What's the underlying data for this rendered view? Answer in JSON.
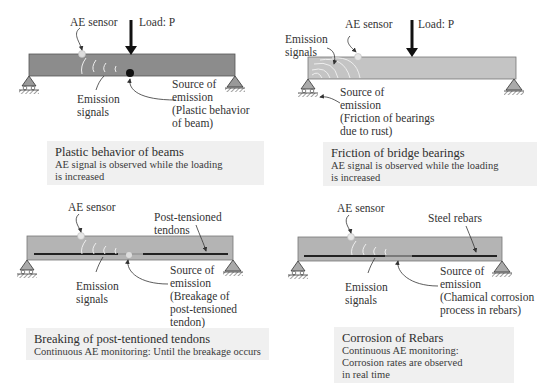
{
  "panels": [
    {
      "id": "plastic-behavior",
      "labels": {
        "sensor": "AE sensor",
        "load": "Load: P",
        "signals": "Emission\nsignals",
        "source": "Source of\nemission\n(Plastic behavior\nof beam)"
      },
      "caption": {
        "title": "Plastic behavior of beams",
        "description": "AE signal is observed while the loading\nis increased"
      },
      "beam_color": "#8c8c8c"
    },
    {
      "id": "bearing-friction",
      "labels": {
        "sensor": "AE sensor",
        "load": "Load: P",
        "signals": "Emission\nsignals",
        "source": "Source of\nemission\n(Friction of bearings\ndue to rust)"
      },
      "caption": {
        "title": "Friction of bridge bearings",
        "description": "AE signal is observed while the loading\nis increased"
      },
      "beam_color": "#c4c4c4"
    },
    {
      "id": "tendon-breakage",
      "labels": {
        "sensor": "AE sensor",
        "tendons": "Post-tensioned\ntendons",
        "signals": "Emission\nsignals",
        "source": "Source of\nemission\n(Breakage of\npost-tensioned\ntendon)"
      },
      "caption": {
        "title": "Breaking of post-tentioned tendons",
        "description": "Continuous AE monitoring: Until the breakage occurs"
      },
      "beam_color": "#b4b4b4"
    },
    {
      "id": "rebar-corrosion",
      "labels": {
        "sensor": "AE sensor",
        "rebars": "Steel rebars",
        "signals": "Emission\nsignals",
        "source": "Source of\nemission\n(Chamical corrosion\nprocess in rebars)"
      },
      "caption": {
        "title": "Corrosion of Rebars",
        "description": "Continuous AE monitoring:\nCorrosion rates are observed\nin real time"
      },
      "beam_color": "#b4b4b4"
    }
  ]
}
